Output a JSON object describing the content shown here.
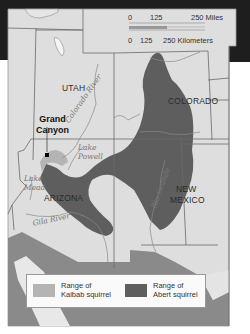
{
  "map": {
    "colors": {
      "frame_dark": "#1e1e1e",
      "land": "#dedede",
      "land_light": "#e6e6e6",
      "mexico_gray": "#8a8a8a",
      "abert_range": "#5e5e5e",
      "kaibab_range": "#b4b4b4",
      "border": "#6a6a6a",
      "river": "#8a8a8a",
      "legend_bg": "#fafafa"
    },
    "scale_bar": {
      "miles": {
        "ticks": [
          "0",
          "125",
          "250 Miles"
        ]
      },
      "kilometers": {
        "ticks": [
          "0",
          "125",
          "250 Kilometers"
        ]
      }
    },
    "states": {
      "utah": "UTAH",
      "colorado": "COLORADO",
      "arizona": "ARIZONA",
      "new_mexico_line1": "NEW",
      "new_mexico_line2": "MEXICO"
    },
    "features": {
      "grand_canyon_line1": "Grand",
      "grand_canyon_line2": "Canyon",
      "colorado_river": "Colorado River",
      "lake_powell_line1": "Lake",
      "lake_powell_line2": "Powell",
      "lake_mead_line1": "Lake",
      "lake_mead_line2": "Mead",
      "gila_river": "Gila River",
      "rio_grande": "Rio Grande"
    },
    "legend": {
      "items": [
        {
          "line1": "Range of",
          "line2": "Kaibab squirrel",
          "color": "#b4b4b4"
        },
        {
          "line1": "Range of",
          "line2": "Abert squirrel",
          "color": "#5e5e5e"
        }
      ]
    }
  }
}
